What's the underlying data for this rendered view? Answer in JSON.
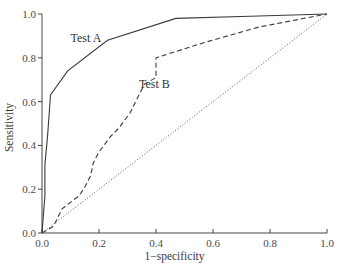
{
  "chart_data": {
    "type": "line",
    "title": "",
    "xlabel": "1−specificity",
    "ylabel": "Sensitivity",
    "xlim": [
      0,
      1
    ],
    "ylim": [
      0,
      1
    ],
    "x_ticks": [
      "0.0",
      "0.2",
      "0.4",
      "0.6",
      "0.8",
      "1.0"
    ],
    "y_ticks": [
      "0.0",
      "0.2",
      "0.4",
      "0.6",
      "0.8",
      "1.0"
    ],
    "grid": false,
    "legend": "none (inline labels)",
    "series": [
      {
        "name": "Test A",
        "style": "solid",
        "color": "#3a3a3a",
        "x": [
          0,
          0.01,
          0.01,
          0.02,
          0.03,
          0.09,
          0.23,
          0.47,
          0.73,
          1.0
        ],
        "y": [
          0,
          0.17,
          0.31,
          0.45,
          0.63,
          0.74,
          0.88,
          0.98,
          0.99,
          1.0
        ],
        "label_pos": [
          0.1,
          0.87
        ]
      },
      {
        "name": "Test B",
        "style": "dashed",
        "color": "#3a3a3a",
        "x": [
          0,
          0.04,
          0.07,
          0.11,
          0.13,
          0.15,
          0.17,
          0.18,
          0.2,
          0.24,
          0.27,
          0.31,
          0.34,
          0.36,
          0.4,
          0.4,
          0.57,
          0.76,
          1.0
        ],
        "y": [
          0,
          0.03,
          0.11,
          0.15,
          0.17,
          0.21,
          0.26,
          0.32,
          0.37,
          0.44,
          0.48,
          0.55,
          0.63,
          0.68,
          0.71,
          0.8,
          0.87,
          0.94,
          1.0
        ],
        "label_pos": [
          0.34,
          0.66
        ]
      },
      {
        "name": "Chance (diagonal)",
        "style": "dotted",
        "color": "#555555",
        "x": [
          0,
          1
        ],
        "y": [
          0,
          1
        ]
      }
    ]
  }
}
